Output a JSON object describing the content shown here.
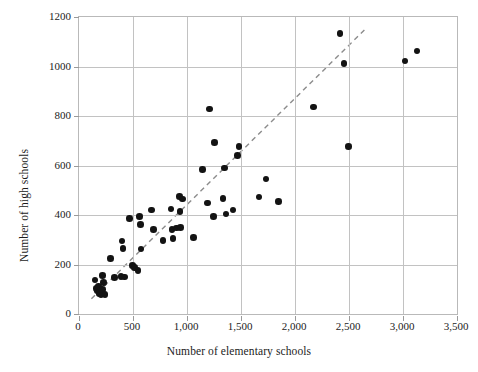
{
  "chart_data": {
    "type": "scatter",
    "title": "",
    "xlabel": "Number of elementary schools",
    "ylabel": "Number of high schools",
    "xlim": [
      0,
      3500
    ],
    "ylim": [
      0,
      1200
    ],
    "xticks": [
      0,
      500,
      1000,
      1500,
      2000,
      2500,
      3000,
      3500
    ],
    "xticklabels": [
      "0",
      "500",
      "1,000",
      "1,500",
      "2,000",
      "2,500",
      "3,000",
      "3,500"
    ],
    "yticks": [
      0,
      200,
      400,
      600,
      800,
      1000,
      1200
    ],
    "yticklabels": [
      "0",
      "200",
      "400",
      "600",
      "800",
      "1000",
      "1200"
    ],
    "grid": true,
    "legend": "none",
    "marker_color": "#131313",
    "grid_color": "#c2c2c2",
    "frame_color": "#b9b9b9",
    "trendline": {
      "style": "dashed",
      "color": "#8c8c8c",
      "x": [
        115,
        2660
      ],
      "y": [
        62,
        1155
      ]
    },
    "points": [
      {
        "x": 150,
        "y": 138
      },
      {
        "x": 163,
        "y": 103
      },
      {
        "x": 168,
        "y": 96
      },
      {
        "x": 180,
        "y": 112
      },
      {
        "x": 185,
        "y": 88
      },
      {
        "x": 192,
        "y": 82
      },
      {
        "x": 198,
        "y": 95
      },
      {
        "x": 203,
        "y": 78
      },
      {
        "x": 210,
        "y": 86
      },
      {
        "x": 215,
        "y": 155
      },
      {
        "x": 218,
        "y": 100
      },
      {
        "x": 228,
        "y": 128
      },
      {
        "x": 240,
        "y": 78
      },
      {
        "x": 290,
        "y": 225
      },
      {
        "x": 330,
        "y": 148
      },
      {
        "x": 390,
        "y": 152
      },
      {
        "x": 400,
        "y": 295
      },
      {
        "x": 408,
        "y": 265
      },
      {
        "x": 422,
        "y": 150
      },
      {
        "x": 470,
        "y": 387
      },
      {
        "x": 498,
        "y": 196
      },
      {
        "x": 512,
        "y": 188
      },
      {
        "x": 545,
        "y": 176
      },
      {
        "x": 560,
        "y": 394
      },
      {
        "x": 568,
        "y": 362
      },
      {
        "x": 575,
        "y": 262
      },
      {
        "x": 672,
        "y": 420
      },
      {
        "x": 690,
        "y": 342
      },
      {
        "x": 778,
        "y": 298
      },
      {
        "x": 852,
        "y": 425
      },
      {
        "x": 862,
        "y": 342
      },
      {
        "x": 872,
        "y": 306
      },
      {
        "x": 905,
        "y": 348
      },
      {
        "x": 930,
        "y": 475
      },
      {
        "x": 935,
        "y": 415
      },
      {
        "x": 942,
        "y": 350
      },
      {
        "x": 958,
        "y": 465
      },
      {
        "x": 1060,
        "y": 308
      },
      {
        "x": 1145,
        "y": 585
      },
      {
        "x": 1190,
        "y": 448
      },
      {
        "x": 1208,
        "y": 828
      },
      {
        "x": 1248,
        "y": 394
      },
      {
        "x": 1255,
        "y": 693
      },
      {
        "x": 1335,
        "y": 466
      },
      {
        "x": 1345,
        "y": 590
      },
      {
        "x": 1360,
        "y": 404
      },
      {
        "x": 1425,
        "y": 420
      },
      {
        "x": 1470,
        "y": 640
      },
      {
        "x": 1482,
        "y": 676
      },
      {
        "x": 1665,
        "y": 472
      },
      {
        "x": 1730,
        "y": 546
      },
      {
        "x": 1845,
        "y": 455
      },
      {
        "x": 2170,
        "y": 836
      },
      {
        "x": 2415,
        "y": 1133
      },
      {
        "x": 2455,
        "y": 1011
      },
      {
        "x": 2495,
        "y": 676
      },
      {
        "x": 3020,
        "y": 1022
      },
      {
        "x": 3130,
        "y": 1062
      }
    ]
  }
}
